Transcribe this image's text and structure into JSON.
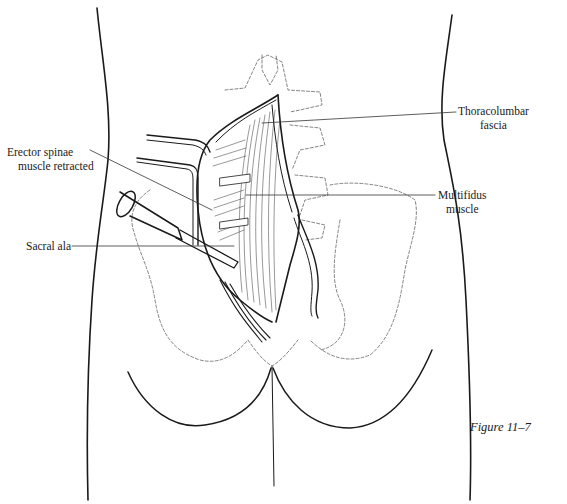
{
  "figure": {
    "caption": "Figure 11–7",
    "type": "surgical illustration",
    "view": "posterior lower back and pelvis"
  },
  "labels": {
    "thoracolumbar": {
      "line1": "Thoracolumbar",
      "line2": "fascia"
    },
    "erector": {
      "line1": "Erector spinae",
      "line2": "muscle retracted"
    },
    "multifidus": {
      "line1": "Multifidus",
      "line2": "muscle"
    },
    "sacral": {
      "line1": "Sacral ala"
    }
  },
  "colors": {
    "ink": "#1a1a1a",
    "bone_outline": "#666666",
    "background": "#ffffff"
  }
}
